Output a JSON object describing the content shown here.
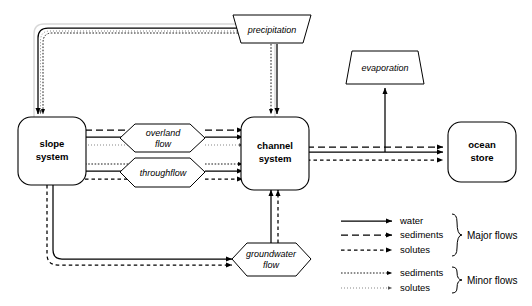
{
  "diagram": {
    "nodes": {
      "slope_system": {
        "label_line1": "slope",
        "label_line2": "system",
        "shape": "rounded-rectangle"
      },
      "channel_system": {
        "label_line1": "channel",
        "label_line2": "system",
        "shape": "rounded-rectangle"
      },
      "ocean_store": {
        "label_line1": "ocean",
        "label_line2": "store",
        "shape": "rounded-rectangle"
      },
      "precipitation": {
        "label": "precipitation",
        "shape": "inverted-trapezoid"
      },
      "evaporation": {
        "label": "evaporation",
        "shape": "trapezoid"
      },
      "overland_flow": {
        "label_line1": "overland",
        "label_line2": "flow",
        "shape": "hexagon"
      },
      "throughflow": {
        "label_line1": "throughflow",
        "label_line2": "",
        "shape": "hexagon"
      },
      "groundwater_flow": {
        "label_line1": "groundwater",
        "label_line2": "flow",
        "shape": "hexagon"
      }
    },
    "legend": {
      "major": {
        "group_label": "Major  flows",
        "items": [
          {
            "label": "water",
            "style": "solid"
          },
          {
            "label": "sediments",
            "style": "long-dash"
          },
          {
            "label": "solutes",
            "style": "short-dash"
          }
        ]
      },
      "minor": {
        "group_label": "Minor  flows",
        "items": [
          {
            "label": "sediments",
            "style": "dotted-medium"
          },
          {
            "label": "solutes",
            "style": "dotted-fine"
          }
        ]
      }
    },
    "colors": {
      "stroke": "#000000",
      "fill": "#ffffff",
      "minor_stroke": "#555555",
      "ghost": "#d8d8d8"
    }
  }
}
